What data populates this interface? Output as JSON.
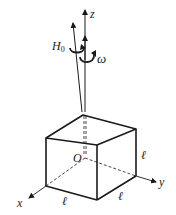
{
  "diagram": {
    "labels": {
      "z_axis": "z",
      "x_axis": "x",
      "y_axis": "y",
      "origin": "O",
      "angular_momentum": "H",
      "angular_momentum_sub": "0",
      "angular_velocity": "ω",
      "side_front_bottom": "ℓ",
      "side_right_bottom": "ℓ",
      "side_right_vertical": "ℓ"
    },
    "colors": {
      "stroke": "#1a1a1a",
      "background": "#ffffff"
    }
  }
}
